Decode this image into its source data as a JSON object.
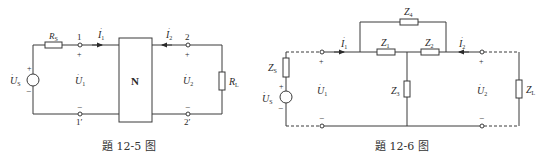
{
  "figures": [
    {
      "caption": "題 12-5 图",
      "labels": {
        "source_voltage": "U",
        "source_sub": "S",
        "rs": "R",
        "rs_sub": "S",
        "node1": "1",
        "node1p": "1′",
        "node2": "2",
        "node2p": "2′",
        "i1": "I",
        "i1_sub": "1",
        "i2": "I",
        "i2_sub": "2",
        "u1": "U",
        "u1_sub": "1",
        "u2": "U",
        "u2_sub": "2",
        "network": "N",
        "rl": "R",
        "rl_sub": "L",
        "plus": "+",
        "minus": "−"
      }
    },
    {
      "caption": "題 12-6 图",
      "labels": {
        "source_voltage": "U",
        "source_sub": "S",
        "zs": "Z",
        "zs_sub": "S",
        "z1": "Z",
        "z1_sub": "1",
        "z2": "Z",
        "z2_sub": "2",
        "z3": "Z",
        "z3_sub": "3",
        "z4": "Z",
        "z4_sub": "4",
        "zl": "Z",
        "zl_sub": "L",
        "i1": "I",
        "i1_sub": "1",
        "i2": "I",
        "i2_sub": "2",
        "u1": "U",
        "u1_sub": "1",
        "u2": "U",
        "u2_sub": "2",
        "plus": "+",
        "minus": "−"
      }
    }
  ]
}
